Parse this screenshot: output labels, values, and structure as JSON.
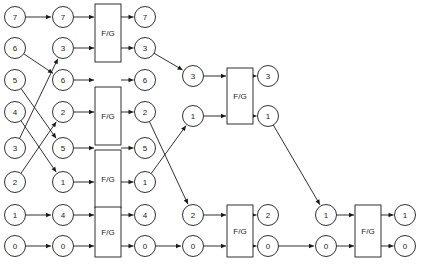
{
  "diagram": {
    "type": "dataflow-network",
    "width": 424,
    "height": 265,
    "background_color": "#ffffff",
    "line_color": "#1a1a1a",
    "node_fill": "#ffffff",
    "box_label": "F/G",
    "geometry": {
      "node_radius": 10.5,
      "column_x": [
        15,
        63,
        145,
        193,
        268,
        326,
        405
      ],
      "row_y": [
        17,
        48,
        80,
        112,
        148,
        182,
        215,
        246
      ],
      "box_width": 26,
      "box_height": 58
    },
    "nodes": [
      {
        "id": "c0r0",
        "label": "7",
        "x": 15,
        "y": 17
      },
      {
        "id": "c0r1",
        "label": "6",
        "x": 15,
        "y": 48
      },
      {
        "id": "c0r2",
        "label": "5",
        "x": 15,
        "y": 80
      },
      {
        "id": "c0r3",
        "label": "4",
        "x": 15,
        "y": 112
      },
      {
        "id": "c0r4",
        "label": "3",
        "x": 15,
        "y": 148
      },
      {
        "id": "c0r5",
        "label": "2",
        "x": 15,
        "y": 182
      },
      {
        "id": "c0r6",
        "label": "1",
        "x": 15,
        "y": 215
      },
      {
        "id": "c0r7",
        "label": "0",
        "x": 15,
        "y": 246
      },
      {
        "id": "c1r0",
        "label": "7",
        "x": 63,
        "y": 17
      },
      {
        "id": "c1r1",
        "label": "3",
        "x": 63,
        "y": 48
      },
      {
        "id": "c1r2",
        "label": "6",
        "x": 63,
        "y": 80
      },
      {
        "id": "c1r3",
        "label": "2",
        "x": 63,
        "y": 112
      },
      {
        "id": "c1r4",
        "label": "5",
        "x": 63,
        "y": 148
      },
      {
        "id": "c1r5",
        "label": "1",
        "x": 63,
        "y": 182
      },
      {
        "id": "c1r6",
        "label": "4",
        "x": 63,
        "y": 215
      },
      {
        "id": "c1r7",
        "label": "0",
        "x": 63,
        "y": 246
      },
      {
        "id": "c2r0",
        "label": "7",
        "x": 145,
        "y": 17
      },
      {
        "id": "c2r1",
        "label": "3",
        "x": 145,
        "y": 48
      },
      {
        "id": "c2r2",
        "label": "6",
        "x": 145,
        "y": 80
      },
      {
        "id": "c2r3",
        "label": "2",
        "x": 145,
        "y": 112
      },
      {
        "id": "c2r4",
        "label": "5",
        "x": 145,
        "y": 148
      },
      {
        "id": "c2r5",
        "label": "1",
        "x": 145,
        "y": 182
      },
      {
        "id": "c2r6",
        "label": "4",
        "x": 145,
        "y": 215
      },
      {
        "id": "c2r7",
        "label": "0",
        "x": 145,
        "y": 246
      },
      {
        "id": "c3a",
        "label": "3",
        "x": 193,
        "y": 76
      },
      {
        "id": "c3b",
        "label": "1",
        "x": 193,
        "y": 116
      },
      {
        "id": "c3c",
        "label": "2",
        "x": 193,
        "y": 215
      },
      {
        "id": "c3d",
        "label": "0",
        "x": 193,
        "y": 246
      },
      {
        "id": "c4a",
        "label": "3",
        "x": 268,
        "y": 76
      },
      {
        "id": "c4b",
        "label": "1",
        "x": 268,
        "y": 116
      },
      {
        "id": "c4c",
        "label": "2",
        "x": 268,
        "y": 215
      },
      {
        "id": "c4d",
        "label": "0",
        "x": 268,
        "y": 246
      },
      {
        "id": "c5a",
        "label": "1",
        "x": 326,
        "y": 215
      },
      {
        "id": "c5b",
        "label": "0",
        "x": 326,
        "y": 246
      },
      {
        "id": "c6a",
        "label": "1",
        "x": 405,
        "y": 215
      },
      {
        "id": "c6b",
        "label": "0",
        "x": 405,
        "y": 246
      }
    ],
    "boxes": [
      {
        "id": "fg1",
        "label": "F/G",
        "x": 95,
        "y": 4,
        "w": 26,
        "h": 58
      },
      {
        "id": "fg2",
        "label": "F/G",
        "x": 95,
        "y": 87,
        "w": 26,
        "h": 58
      },
      {
        "id": "fg3",
        "label": "F/G",
        "x": 95,
        "y": 150,
        "w": 26,
        "h": 58
      },
      {
        "id": "fg4",
        "label": "F/G",
        "x": 95,
        "y": 207,
        "w": 26,
        "h": 50
      },
      {
        "id": "fg5",
        "label": "F/G",
        "x": 227,
        "y": 68,
        "w": 26,
        "h": 56
      },
      {
        "id": "fg6",
        "label": "F/G",
        "x": 227,
        "y": 205,
        "w": 26,
        "h": 52
      },
      {
        "id": "fg7",
        "label": "F/G",
        "x": 355,
        "y": 205,
        "w": 26,
        "h": 52
      }
    ],
    "edges": [
      {
        "from": "c0r0",
        "to": "c1r0",
        "kind": "straight"
      },
      {
        "from": "c0r1",
        "to": "c1r2",
        "kind": "cross"
      },
      {
        "from": "c0r2",
        "to": "c1r4",
        "kind": "cross"
      },
      {
        "from": "c0r3",
        "to": "c1r5",
        "kind": "cross"
      },
      {
        "from": "c0r4",
        "to": "c1r1",
        "kind": "cross"
      },
      {
        "from": "c0r5",
        "to": "c1r3",
        "kind": "cross"
      },
      {
        "from": "c0r6",
        "to": "c1r6",
        "kind": "cross"
      },
      {
        "from": "c0r7",
        "to": "c1r7",
        "kind": "straight"
      },
      {
        "from": "c1r0",
        "to": "fg1",
        "kind": "into-box"
      },
      {
        "from": "c1r1",
        "to": "fg1",
        "kind": "into-box"
      },
      {
        "from": "fg1",
        "to": "c2r0",
        "kind": "out-of-box"
      },
      {
        "from": "fg1",
        "to": "c2r1",
        "kind": "out-of-box"
      },
      {
        "from": "c1r2",
        "to": "fg2",
        "kind": "into-box"
      },
      {
        "from": "c1r3",
        "to": "fg2",
        "kind": "into-box"
      },
      {
        "from": "fg2",
        "to": "c2r2",
        "kind": "out-of-box"
      },
      {
        "from": "fg2",
        "to": "c2r3",
        "kind": "out-of-box"
      },
      {
        "from": "c1r4",
        "to": "fg3",
        "kind": "into-box"
      },
      {
        "from": "c1r5",
        "to": "fg3",
        "kind": "into-box"
      },
      {
        "from": "fg3",
        "to": "c2r4",
        "kind": "out-of-box"
      },
      {
        "from": "fg3",
        "to": "c2r5",
        "kind": "out-of-box"
      },
      {
        "from": "c1r6",
        "to": "fg4",
        "kind": "into-box"
      },
      {
        "from": "c1r7",
        "to": "fg4",
        "kind": "into-box"
      },
      {
        "from": "fg4",
        "to": "c2r6",
        "kind": "out-of-box"
      },
      {
        "from": "fg4",
        "to": "c2r7",
        "kind": "out-of-box"
      },
      {
        "from": "c2r1",
        "to": "c3a",
        "kind": "cross"
      },
      {
        "from": "c2r3",
        "to": "c3c",
        "kind": "cross"
      },
      {
        "from": "c2r5",
        "to": "c3b",
        "kind": "cross"
      },
      {
        "from": "c2r7",
        "to": "c3d",
        "kind": "straight"
      },
      {
        "from": "c3a",
        "to": "fg5",
        "kind": "into-box"
      },
      {
        "from": "c3b",
        "to": "fg5",
        "kind": "into-box"
      },
      {
        "from": "fg5",
        "to": "c4a",
        "kind": "out-of-box"
      },
      {
        "from": "fg5",
        "to": "c4b",
        "kind": "out-of-box"
      },
      {
        "from": "c3c",
        "to": "fg6",
        "kind": "into-box"
      },
      {
        "from": "c3d",
        "to": "fg6",
        "kind": "into-box"
      },
      {
        "from": "fg6",
        "to": "c4c",
        "kind": "out-of-box"
      },
      {
        "from": "fg6",
        "to": "c4d",
        "kind": "out-of-box"
      },
      {
        "from": "c4b",
        "to": "c5a",
        "kind": "cross"
      },
      {
        "from": "c4d",
        "to": "c5b",
        "kind": "straight"
      },
      {
        "from": "c5a",
        "to": "fg7",
        "kind": "into-box"
      },
      {
        "from": "c5b",
        "to": "fg7",
        "kind": "into-box"
      },
      {
        "from": "fg7",
        "to": "c6a",
        "kind": "out-of-box"
      },
      {
        "from": "fg7",
        "to": "c6b",
        "kind": "out-of-box"
      }
    ]
  }
}
